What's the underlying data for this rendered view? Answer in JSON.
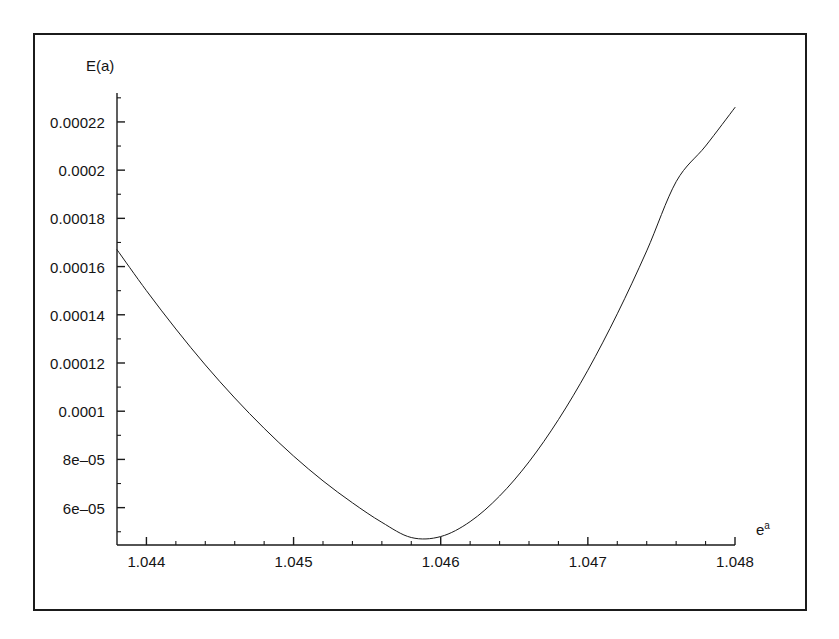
{
  "figure": {
    "background_color": "#ffffff",
    "frame_color": "#1b1b1b",
    "curve_color": "#1a1a1a"
  },
  "axis_titles": {
    "y_title": "E(a)",
    "x_title_base": "e",
    "x_title_exponent": "a"
  },
  "y_tick_labels": [
    "0.00022",
    "0.0002",
    "0.00018",
    "0.00016",
    "0.00014",
    "0.00012",
    "0.0001",
    "8e‒05",
    "6e‒05"
  ],
  "x_tick_labels": [
    "1.044",
    "1.045",
    "1.046",
    "1.047",
    "1.048"
  ],
  "chart_data": {
    "type": "line",
    "title": "",
    "subtitle": "",
    "xlabel": "e^a",
    "ylabel": "E(a)",
    "grid": false,
    "legend": false,
    "legend_position": "none",
    "xlim": [
      1.0438,
      1.048
    ],
    "ylim": [
      4.45e-05,
      0.000232
    ],
    "xticks": [
      1.044,
      1.045,
      1.046,
      1.047,
      1.048
    ],
    "xticklabels": [
      "1.044",
      "1.045",
      "1.046",
      "1.047",
      "1.048"
    ],
    "yticks": [
      6e-05,
      8e-05,
      0.0001,
      0.00012,
      0.00014,
      0.00016,
      0.00018,
      0.0002,
      0.00022
    ],
    "yticklabels": [
      "6e‒05",
      "8e‒05",
      "0.0001",
      "0.00012",
      "0.00014",
      "0.00016",
      "0.00018",
      "0.0002",
      "0.00022"
    ],
    "minor_ticks": true,
    "annotations": [],
    "series": [
      {
        "name": "E(a)",
        "color": "#1a1a1a",
        "linewidth": 1,
        "minimum": {
          "x": 1.04578,
          "y": 4.68e-05
        },
        "x": [
          1.0438,
          1.044,
          1.0442,
          1.0444,
          1.0446,
          1.0448,
          1.045,
          1.0452,
          1.0454,
          1.0456,
          1.0458,
          1.046,
          1.0462,
          1.0464,
          1.0466,
          1.0468,
          1.047,
          1.0472,
          1.0474,
          1.0476,
          1.0478,
          1.048
        ],
        "y": [
          0.000167,
          0.00015,
          0.0001341,
          0.0001192,
          0.0001055,
          9.29e-05,
          8.14e-05,
          7.11e-05,
          6.2e-05,
          5.39e-05,
          4.76e-05,
          4.8e-05,
          5.42e-05,
          6.48e-05,
          7.9e-05,
          9.65e-05,
          0.000117,
          0.0001404,
          0.0001665,
          0.0001952,
          0.00021,
          0.000226
        ]
      }
    ]
  },
  "geometry": {
    "plot_left_px": 117,
    "plot_right_px": 735,
    "plot_top_px": 93,
    "plot_bottom_px": 545
  }
}
